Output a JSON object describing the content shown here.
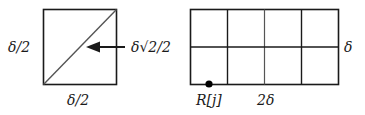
{
  "left_figure": {
    "side_left_label": "δ/2",
    "side_bottom_label": "δ/2",
    "diagonal_label": "δ√2/2",
    "arrow": "points-left-to-diagonal"
  },
  "right_figure": {
    "grid": {
      "columns": 4,
      "rows": 2
    },
    "right_label": "δ",
    "bottom_label": "2δ",
    "point_label": "R[j]"
  },
  "colors": {
    "line": "#1a1a1a",
    "diagonal": "#555555",
    "background": "#ffffff"
  }
}
